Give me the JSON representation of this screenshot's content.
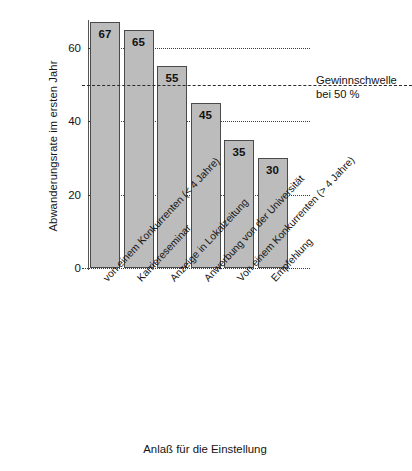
{
  "chart_data": {
    "type": "bar",
    "title": "",
    "xlabel": "Anlaß für die Einstellung",
    "ylabel": "Abwanderungsrate im ersten Jahr",
    "ylim": [
      0,
      70
    ],
    "yticks": [
      0,
      20,
      40,
      60
    ],
    "ytick_labels": [
      "0",
      "20",
      "40",
      "60"
    ],
    "grid": "horizontal dotted at 0, 20, 40, 60",
    "legend": "none",
    "categories": [
      "von einem Konkurrenten (< 4 Jahre)",
      "Karriereseminar",
      "Anzeige in Lokalzeitung",
      "Anwerbung von der Universität",
      "Von einem Konkurrenten (> 4 Jahre)",
      "Empfehlung"
    ],
    "values": [
      67,
      65,
      55,
      45,
      35,
      30
    ],
    "value_labels": [
      "67",
      "65",
      "55",
      "45",
      "35",
      "30"
    ],
    "annotations": [
      {
        "name": "break-even-line",
        "value": 50,
        "style": "dashed",
        "text_line1": "Gewinnschwelle",
        "text_line2": "bei 50 %"
      }
    ],
    "colors": {
      "bar_fill": "#bcbcbc",
      "bar_border": "#4a4a4a",
      "grid": "#3a3a3a",
      "text": "#141414",
      "background": "#ffffff"
    }
  },
  "axis": {
    "y_title": "Abwanderungsrate im ersten Jahr",
    "x_title": "Anlaß für die Einstellung",
    "ticks": [
      "60",
      "40",
      "20",
      "0"
    ]
  },
  "annotation": {
    "line1": "Gewinnschwelle",
    "line2": "bei 50 %"
  }
}
